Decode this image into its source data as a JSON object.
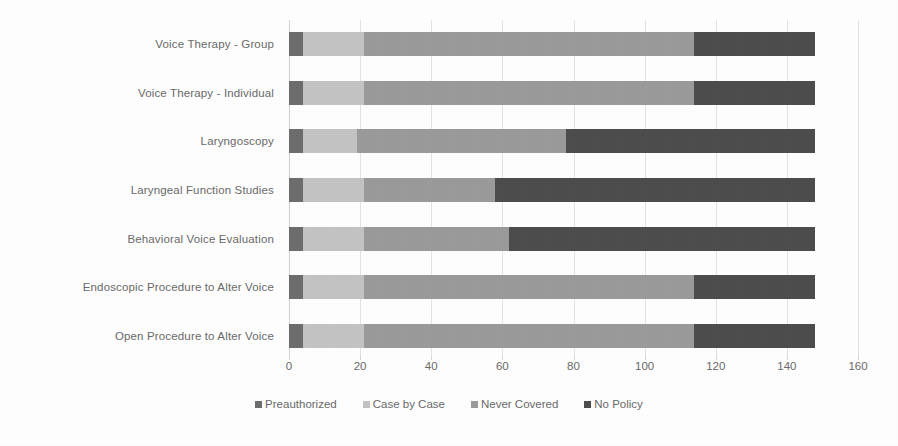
{
  "chart_data": {
    "type": "bar",
    "orientation": "horizontal",
    "stacked": true,
    "title": "",
    "subtitle": "",
    "xlabel": "",
    "ylabel": "",
    "xlim": [
      0,
      160
    ],
    "xticks": [
      0,
      20,
      40,
      60,
      80,
      100,
      120,
      140,
      160
    ],
    "xtick_labels": [
      "0",
      "20",
      "40",
      "60",
      "80",
      "100",
      "120",
      "140",
      "160"
    ],
    "grid": true,
    "grid_axis": "x",
    "legend_position": "bottom",
    "categories": [
      "Voice Therapy - Group",
      "Voice Therapy - Individual",
      "Laryngoscopy",
      "Laryngeal Function Studies",
      "Behavioral Voice Evaluation",
      "Endoscopic Procedure to Alter Voice",
      "Open Procedure to Alter Voice"
    ],
    "series": [
      {
        "name": "Preauthorized",
        "color": "#6e6e6e",
        "values": [
          4,
          4,
          4,
          4,
          4,
          4,
          4
        ]
      },
      {
        "name": "Case by Case",
        "color": "#c4c4c4",
        "values": [
          17,
          17,
          15,
          17,
          17,
          17,
          17
        ]
      },
      {
        "name": "Never Covered",
        "color": "#9b9b9b",
        "values": [
          93,
          93,
          59,
          37,
          41,
          93,
          93
        ]
      },
      {
        "name": "No Policy",
        "color": "#4d4d4d",
        "values": [
          34,
          34,
          70,
          90,
          86,
          34,
          34
        ]
      }
    ],
    "totals": [
      148,
      148,
      148,
      148,
      148,
      148,
      148
    ]
  },
  "legend": {
    "items": [
      {
        "label": "Preauthorized",
        "color": "#6e6e6e"
      },
      {
        "label": "Case by Case",
        "color": "#c4c4c4"
      },
      {
        "label": "Never Covered",
        "color": "#9b9b9b"
      },
      {
        "label": "No Policy",
        "color": "#4d4d4d"
      }
    ]
  },
  "colors": {
    "background": "#ffffff",
    "text": "#6a6a6a",
    "gridline": "#e4e4e4",
    "axis": "#d2d2d2"
  }
}
